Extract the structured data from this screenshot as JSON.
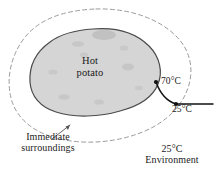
{
  "figure": {
    "colors": {
      "potato_fill": "#d5d5d5",
      "potato_outline": "#4a4a4a",
      "spot_fill": "#c0c0c0",
      "dashed_boundary": "#9a9a9a",
      "arrow_line": "#111111",
      "text": "#1a1a1a",
      "background": "#ffffff"
    },
    "body": {
      "name": "hot-potato",
      "label_line1": "Hot",
      "label_line2": "potato"
    },
    "annotations": {
      "surface_temperature": "70°C",
      "surroundings_temperature": "25°C",
      "surroundings_label_line1": "Immediate",
      "surroundings_label_line2": "surroundings",
      "environment_label_line1": "25°C",
      "environment_label_line2": "Environment"
    }
  }
}
